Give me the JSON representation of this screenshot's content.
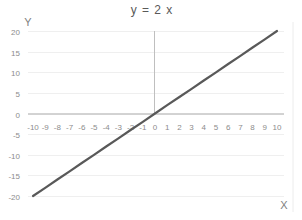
{
  "chart_data": {
    "type": "line",
    "title": "y = 2 x",
    "xlabel": "X",
    "ylabel": "Y",
    "x": [
      -10,
      -9,
      -8,
      -7,
      -6,
      -5,
      -4,
      -3,
      -2,
      -1,
      0,
      1,
      2,
      3,
      4,
      5,
      6,
      7,
      8,
      9,
      10
    ],
    "series": [
      {
        "name": "y = 2x",
        "values": [
          -20,
          -18,
          -16,
          -14,
          -12,
          -10,
          -8,
          -6,
          -4,
          -2,
          0,
          2,
          4,
          6,
          8,
          10,
          12,
          14,
          16,
          18,
          20
        ],
        "color": "#595959"
      }
    ],
    "xlim": [
      -10,
      10
    ],
    "ylim": [
      -20,
      20
    ],
    "x_ticks": [
      "-10",
      "-9",
      "-8",
      "-7",
      "-6",
      "-5",
      "-4",
      "-3",
      "-2",
      "-1",
      "0",
      "1",
      "2",
      "3",
      "4",
      "5",
      "6",
      "7",
      "8",
      "9",
      "10"
    ],
    "y_ticks": [
      "20",
      "15",
      "10",
      "5",
      "0",
      "-5",
      "-10",
      "-15",
      "-20"
    ],
    "grid": true,
    "legend": "none",
    "colors": {
      "line": "#595959",
      "grid": "#efefef",
      "axis": "#bfbfbf",
      "text": "#8c8c8c"
    }
  }
}
